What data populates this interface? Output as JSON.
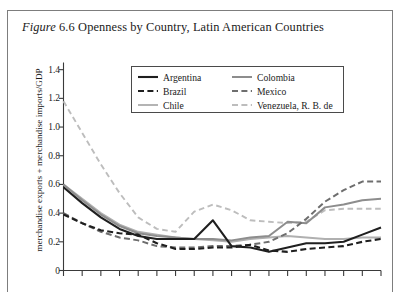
{
  "figure": {
    "label_italic": "Figure",
    "number": "6.6",
    "title_rest": "Openness by Country, Latin American Countries"
  },
  "legend": {
    "columns": [
      [
        {
          "label": "Argentina",
          "color": "#1f1f1f",
          "dash": "solid",
          "width": 2.1
        },
        {
          "label": "Brazil",
          "color": "#1f1f1f",
          "dash": "dashed",
          "width": 2.1
        },
        {
          "label": "Chile",
          "color": "#b0b0b0",
          "dash": "solid",
          "width": 1.9
        }
      ],
      [
        {
          "label": "Colombia",
          "color": "#8d8d8d",
          "dash": "solid",
          "width": 2.0
        },
        {
          "label": "Mexico",
          "color": "#6e6e6e",
          "dash": "dashed",
          "width": 2.0
        },
        {
          "label": "Venezuela, R. B. de",
          "color": "#bdbdbd",
          "dash": "dashed",
          "width": 1.9
        }
      ]
    ]
  },
  "chart_data": {
    "type": "line",
    "title": "Openness by Country, Latin American Countries",
    "xlabel": "",
    "ylabel": "merchandise exports + merchandise imports/GDP",
    "ylim": [
      0,
      1.45
    ],
    "yticks": [
      0,
      0.2,
      0.4,
      0.6,
      0.8,
      1.0,
      1.2,
      1.4
    ],
    "ytick_labels": [
      "0",
      "0.2",
      "0.4",
      "0.6",
      "0.8",
      "1.0",
      "1.2",
      "1.4"
    ],
    "grid": false,
    "legend_position": "upper-center",
    "x_count": 18,
    "x": [
      1,
      2,
      3,
      4,
      5,
      6,
      7,
      8,
      9,
      10,
      11,
      12,
      13,
      14,
      15,
      16,
      17,
      18
    ],
    "xtick_labels": [
      "",
      "",
      "",
      "",
      "",
      "",
      "",
      "",
      "",
      "",
      "",
      "",
      "",
      "",
      "",
      "",
      "",
      ""
    ],
    "series": [
      {
        "name": "Argentina",
        "color": "#1f1f1f",
        "dash": "solid",
        "values": [
          0.58,
          0.47,
          0.37,
          0.29,
          0.24,
          0.22,
          0.22,
          0.22,
          0.35,
          0.17,
          0.16,
          0.13,
          0.16,
          0.19,
          0.19,
          0.2,
          0.25,
          0.3
        ]
      },
      {
        "name": "Brazil",
        "color": "#1f1f1f",
        "dash": "dashed",
        "values": [
          0.39,
          0.33,
          0.28,
          0.26,
          0.25,
          0.19,
          0.15,
          0.15,
          0.16,
          0.16,
          0.18,
          0.14,
          0.13,
          0.15,
          0.16,
          0.17,
          0.2,
          0.22
        ]
      },
      {
        "name": "Chile",
        "color": "#b0b0b0",
        "dash": "solid",
        "values": [
          0.6,
          0.5,
          0.4,
          0.32,
          0.27,
          0.25,
          0.23,
          0.22,
          0.21,
          0.2,
          0.22,
          0.23,
          0.24,
          0.23,
          0.22,
          0.22,
          0.23,
          0.23
        ]
      },
      {
        "name": "Colombia",
        "color": "#8d8d8d",
        "dash": "solid",
        "values": [
          0.6,
          0.49,
          0.39,
          0.31,
          0.26,
          0.24,
          0.23,
          0.22,
          0.22,
          0.21,
          0.23,
          0.24,
          0.34,
          0.33,
          0.44,
          0.46,
          0.49,
          0.5
        ]
      },
      {
        "name": "Mexico",
        "color": "#6e6e6e",
        "dash": "dashed",
        "values": [
          0.4,
          0.33,
          0.27,
          0.23,
          0.21,
          0.17,
          0.16,
          0.16,
          0.17,
          0.17,
          0.18,
          0.2,
          0.26,
          0.36,
          0.48,
          0.56,
          0.62,
          0.62
        ]
      },
      {
        "name": "Venezuela, R. B. de",
        "color": "#bdbdbd",
        "dash": "dashed",
        "values": [
          1.18,
          0.96,
          0.74,
          0.54,
          0.37,
          0.29,
          0.27,
          0.41,
          0.46,
          0.42,
          0.35,
          0.34,
          0.33,
          0.34,
          0.42,
          0.43,
          0.43,
          0.43
        ]
      }
    ]
  }
}
